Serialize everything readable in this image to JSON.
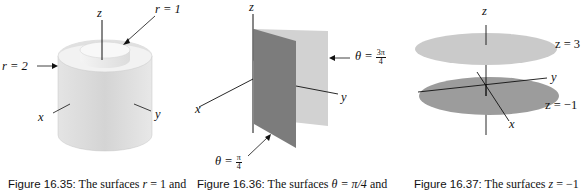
{
  "figures": [
    {
      "id": "fig-16-35",
      "caption": {
        "number": "Figure 16.35:",
        "text_before": "The surfaces ",
        "math": "r",
        "text_after": " = 1 and"
      },
      "labels": {
        "z_axis": "z",
        "x_axis": "x",
        "y_axis": "y",
        "inner_surface": "r = 1",
        "outer_surface": "r = 2"
      },
      "colors": {
        "surface": "#d9d9d9",
        "surface_shadow": "#bdbdbd"
      }
    },
    {
      "id": "fig-16-36",
      "caption": {
        "number": "Figure 16.36:",
        "text_before": "The surfaces ",
        "math": "θ = π/4",
        "text_after": " and"
      },
      "labels": {
        "z_axis": "z",
        "x_axis": "x",
        "y_axis": "y",
        "plane_1_lhs": "θ =",
        "plane_1_num": "π",
        "plane_1_den": "4",
        "plane_2_lhs": "θ =",
        "plane_2_num": "3π",
        "plane_2_den": "4"
      },
      "colors": {
        "front_plane": "#7a7a7a",
        "back_plane": "#cfcfcf"
      }
    },
    {
      "id": "fig-16-37",
      "caption": {
        "number": "Figure 16.37:",
        "text_before": "The surfaces ",
        "math": "z",
        "text_after": " = −1"
      },
      "labels": {
        "z_axis": "z",
        "x_axis": "x",
        "y_axis": "y",
        "upper_plane": "z = 3",
        "lower_plane": "z = −1"
      },
      "colors": {
        "upper_disc": "#c8c8c8",
        "lower_disc": "#9a9a9a"
      }
    }
  ]
}
